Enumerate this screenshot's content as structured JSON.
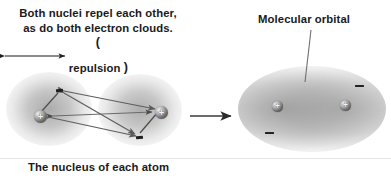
{
  "figure": {
    "title_top_left_caption": {
      "lines": [
        "Both nuclei repel each other,",
        "as do both electron clouds."
      ],
      "open_paren": "(",
      "close_paren": ")",
      "arrow_label": "repulsion"
    },
    "molecular_orbital_label": "Molecular orbital",
    "bottom_caption": "The nucleus of each atom",
    "colors": {
      "text": "#1a1a1a",
      "cloud": "#8c8c8c",
      "nucleus_dark": "#2e2e2e",
      "nucleus_light": "#f0f0f0",
      "arrow": "#555555",
      "electron": "#1f1f1f",
      "background": "#ffffff"
    },
    "left_panel": {
      "name": "two separate atoms with separate electron clouds",
      "nuclei": [
        {
          "label": "+",
          "x": 40,
          "y": 117
        },
        {
          "label": "+",
          "x": 161,
          "y": 112
        }
      ],
      "electrons": [
        {
          "label": "electron",
          "x": 60,
          "y": 90
        },
        {
          "label": "electron",
          "x": 140,
          "y": 137
        }
      ],
      "repulsion_arrows": [
        {
          "from": "nucleus-left",
          "to": "nucleus-right"
        },
        {
          "from": "electron-top",
          "to": "electron-bottom"
        },
        {
          "from": "electron-top",
          "to": "nucleus-right"
        },
        {
          "from": "nucleus-left",
          "to": "electron-bottom"
        }
      ]
    },
    "transition_arrow": {
      "direction": "right",
      "x1": 190,
      "y1": 116,
      "x2": 232,
      "y2": 116
    },
    "right_panel": {
      "name": "molecular orbital with merged electron cloud",
      "nuclei": [
        {
          "label": "+",
          "x": 278,
          "y": 107
        },
        {
          "label": "+",
          "x": 345,
          "y": 106
        }
      ],
      "electrons": [
        {
          "label": "−",
          "x": 359,
          "y": 86
        },
        {
          "label": "−",
          "x": 269,
          "y": 133
        }
      ]
    }
  }
}
